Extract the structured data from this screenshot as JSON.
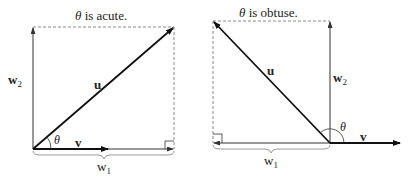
{
  "left": {
    "title_theta": "θ",
    "title_rest": " is acute.",
    "u": "u",
    "v": "v",
    "w2_main": "w",
    "w2_sub": "2",
    "w1_main": "w",
    "w1_sub": "1",
    "theta": "θ"
  },
  "right": {
    "title_theta": "θ",
    "title_rest": " is obtuse.",
    "u": "u",
    "v": "v",
    "w2_main": "w",
    "w2_sub": "2",
    "w1_main": "w",
    "w1_sub": "1",
    "theta": "θ"
  },
  "colors": {
    "stroke": "#111111",
    "thin": "#333333",
    "dashed": "#888888",
    "brace": "#999999"
  }
}
